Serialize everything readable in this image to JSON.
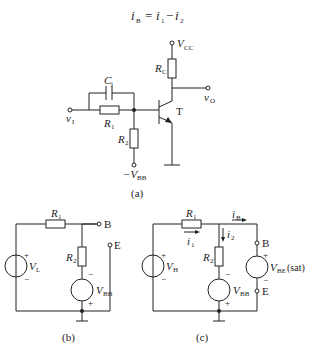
{
  "equation": {
    "lhs_var": "i",
    "lhs_sub": "B",
    "rhs": [
      {
        "var": "i",
        "sub": "1"
      },
      {
        "op": "−"
      },
      {
        "var": "i",
        "sub": "2"
      }
    ]
  },
  "fig_a": {
    "caption": "(a)",
    "labels": {
      "vcc": "V",
      "vcc_sub": "CC",
      "rc": "R",
      "rc_sub": "C",
      "c1": "C",
      "c1_sub": "j",
      "r1": "R",
      "r1_sub": "1",
      "r2": "R",
      "r2_sub": "2",
      "vi": "v",
      "vi_sub": "I",
      "vo": "v",
      "vo_sub": "O",
      "t": "T",
      "vbb": "−V",
      "vbb_sub": "BB"
    }
  },
  "fig_b": {
    "caption": "(b)",
    "labels": {
      "r1": "R",
      "r1_sub": "1",
      "r2": "R",
      "r2_sub": "2",
      "vl": "V",
      "vl_sub": "L",
      "vbb": "V",
      "vbb_sub": "BB",
      "b": "B",
      "e": "E",
      "plus": "+",
      "minus": "−"
    }
  },
  "fig_c": {
    "caption": "(c)",
    "labels": {
      "r1": "R",
      "r1_sub": "1",
      "r2": "R",
      "r2_sub": "2",
      "vh": "V",
      "vh_sub": "H",
      "vbb": "V",
      "vbb_sub": "BB",
      "i1": "i",
      "i1_sub": "1",
      "i2": "i",
      "i2_sub": "2",
      "ib": "i",
      "ib_sub": "B",
      "b": "B",
      "e": "E",
      "vbe": "V",
      "vbe_sub": "BE",
      "vbe_suffix": "(sat)",
      "plus": "+",
      "minus": "−"
    }
  }
}
